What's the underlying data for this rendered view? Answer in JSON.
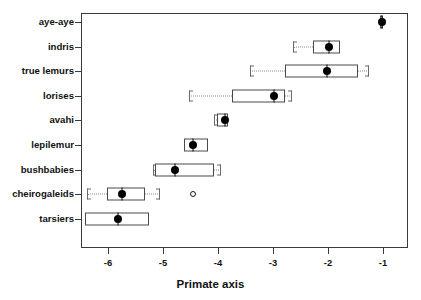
{
  "chart_data": {
    "type": "bar",
    "title": "",
    "xlabel": "Primate axis",
    "ylabel": "",
    "xlim": [
      -6.5,
      -0.6
    ],
    "ylim": [
      0,
      9
    ],
    "grid": false,
    "legend": null,
    "xticks": [
      -6,
      -5,
      -4,
      -3,
      -2,
      -1
    ],
    "xticklabels": [
      "-6",
      "-5",
      "-4",
      "-3",
      "-2",
      "-1"
    ],
    "categories": [
      "aye-aye",
      "indris",
      "true lemurs",
      "lorises",
      "avahi",
      "lepilemur",
      "bushbabies",
      "cheirogaleids",
      "tarsiers"
    ],
    "boxes": [
      {
        "category": "aye-aye",
        "median": -1.02,
        "box_low": -1.05,
        "box_high": -1.0,
        "whisker_low": -1.05,
        "whisker_high": -1.0,
        "outliers": []
      },
      {
        "category": "indris",
        "median": -1.98,
        "box_low": -2.28,
        "box_high": -1.78,
        "whisker_low": -2.64,
        "whisker_high": -1.78,
        "outliers": []
      },
      {
        "category": "true lemurs",
        "median": -2.02,
        "box_low": -2.78,
        "box_high": -1.45,
        "whisker_low": -3.42,
        "whisker_high": -1.25,
        "outliers": []
      },
      {
        "category": "lorises",
        "median": -2.98,
        "box_low": -3.75,
        "box_high": -2.78,
        "whisker_low": -4.52,
        "whisker_high": -2.65,
        "outliers": []
      },
      {
        "category": "avahi",
        "median": -3.88,
        "box_low": -4.02,
        "box_high": -3.82,
        "whisker_low": -4.08,
        "whisker_high": -3.82,
        "outliers": []
      },
      {
        "category": "lepilemur",
        "median": -4.45,
        "box_low": -4.62,
        "box_high": -4.18,
        "whisker_low": -4.62,
        "whisker_high": -4.18,
        "outliers": []
      },
      {
        "category": "bushbabies",
        "median": -4.78,
        "box_low": -5.15,
        "box_high": -4.08,
        "whisker_low": -5.18,
        "whisker_high": -3.95,
        "outliers": []
      },
      {
        "category": "cheirogaleids",
        "median": -5.75,
        "box_low": -6.02,
        "box_high": -5.32,
        "whisker_low": -6.38,
        "whisker_high": -5.05,
        "outliers": [
          -4.45
        ]
      },
      {
        "category": "tarsiers",
        "median": -5.82,
        "box_low": -6.42,
        "box_high": -5.25,
        "whisker_low": -6.42,
        "whisker_high": -5.25,
        "outliers": []
      }
    ]
  },
  "axis": {
    "x_title": "Primate axis"
  }
}
